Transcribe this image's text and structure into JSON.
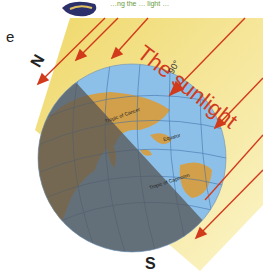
{
  "diagram": {
    "caption_partial": "…ng the … light …",
    "edge_letter": "e",
    "north_label": "N",
    "south_label": "S",
    "sunlight_label": "The sunlight",
    "angle_label": "90°",
    "latitudes": {
      "cancer": "Tropic of Cancer",
      "equator": "Equator",
      "capricorn": "Tropic of Capricorn"
    },
    "colors": {
      "sunlight_band": "#f3e58a",
      "ray": "#d23a1c",
      "ocean": "#8ec0e8",
      "land": "#d2a04a",
      "night": "#6b6b6b",
      "grid": "#3d6fa8"
    }
  }
}
